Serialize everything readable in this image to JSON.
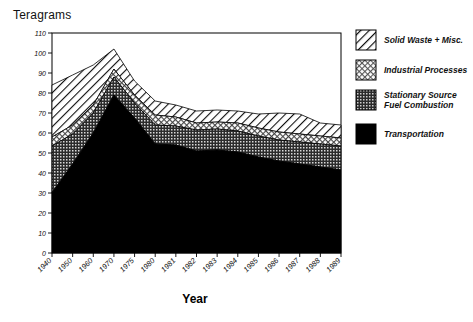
{
  "chart_data": {
    "type": "area",
    "stacked": true,
    "title": "",
    "ylabel": "Teragrams",
    "xlabel": "Year",
    "ylim": [
      0,
      110
    ],
    "yticks": [
      0,
      10,
      20,
      30,
      40,
      50,
      60,
      70,
      80,
      90,
      100,
      110
    ],
    "grid": false,
    "legend_position": "right",
    "categories": [
      "1940",
      "1950",
      "1960",
      "1970",
      "1975",
      "1980",
      "1981",
      "1982",
      "1983",
      "1984",
      "1985",
      "1986",
      "1987",
      "1988",
      "1989"
    ],
    "x": [
      "1940",
      "1950",
      "1960",
      "1970",
      "1975",
      "1980",
      "1981",
      "1982",
      "1983",
      "1984",
      "1985",
      "1986",
      "1987",
      "1988",
      "1989"
    ],
    "series": [
      {
        "name": "Transportation",
        "pattern": "solid-black",
        "color": "#000000",
        "values": [
          30.1,
          44.5,
          60.0,
          79.0,
          67.5,
          54.5,
          54.0,
          51.0,
          51.5,
          50.5,
          48.0,
          46.0,
          44.5,
          43.0,
          41.5
        ]
      },
      {
        "name": "Stationary Source Fuel Combustion",
        "pattern": "dense-dark-dots",
        "color": "#3a3a3a",
        "values": [
          23.4,
          15.0,
          10.0,
          9.0,
          7.5,
          9.5,
          9.5,
          10.5,
          10.5,
          10.5,
          10.5,
          10.5,
          11.0,
          11.5,
          12.0
        ]
      },
      {
        "name": "Industrial Processes",
        "pattern": "light-crosshatch",
        "color": "#b4b4b4",
        "values": [
          4.5,
          4.5,
          4.0,
          4.0,
          4.0,
          5.0,
          4.5,
          3.5,
          3.5,
          4.0,
          4.0,
          4.0,
          4.0,
          4.0,
          4.0
        ]
      },
      {
        "name": "Solid Waste + Misc.",
        "pattern": "diagonal-hatch",
        "color": "#ffffff",
        "values": [
          26.0,
          25.0,
          20.0,
          10.0,
          7.0,
          7.0,
          6.0,
          6.0,
          6.0,
          6.0,
          7.0,
          9.5,
          10.0,
          6.5,
          6.5
        ]
      }
    ],
    "stack_tops": {
      "transportation": [
        30.1,
        44.5,
        60.0,
        79.0,
        67.5,
        54.5,
        54.0,
        51.0,
        51.5,
        50.5,
        48.0,
        46.0,
        44.5,
        43.0,
        41.5
      ],
      "stationary_source": [
        53.5,
        59.5,
        70.0,
        88.0,
        75.0,
        64.0,
        63.5,
        61.5,
        62.0,
        61.0,
        58.5,
        56.5,
        55.5,
        54.5,
        53.5
      ],
      "industrial_processes": [
        58.0,
        64.0,
        74.0,
        92.0,
        79.0,
        69.0,
        68.0,
        65.0,
        65.5,
        65.0,
        62.5,
        60.5,
        59.5,
        58.5,
        57.5
      ],
      "total": [
        84.0,
        89.0,
        94.0,
        102.0,
        86.0,
        76.0,
        74.0,
        71.0,
        71.5,
        71.0,
        69.5,
        70.0,
        69.5,
        65.0,
        64.0
      ]
    }
  },
  "axes": {
    "ylabel": "Teragrams",
    "xlabel": "Year",
    "yticks": [
      "0",
      "10",
      "20",
      "30",
      "40",
      "50",
      "60",
      "70",
      "80",
      "90",
      "100",
      "110"
    ],
    "xticks": [
      "1940",
      "1950",
      "1960",
      "1970",
      "1975",
      "1980",
      "1981",
      "1982",
      "1983",
      "1984",
      "1985",
      "1986",
      "1987",
      "1988",
      "1989"
    ]
  },
  "legend": {
    "items": [
      {
        "label": "Solid Waste + Misc.",
        "label2": "",
        "swatch": "diagonal-hatch-swatch"
      },
      {
        "label": "Industrial Processes",
        "label2": "",
        "swatch": "light-crosshatch-swatch"
      },
      {
        "label": "Stationary Source",
        "label2": "Fuel Combustion",
        "swatch": "dense-dark-swatch"
      },
      {
        "label": "Transportation",
        "label2": "",
        "swatch": "solid-black-swatch"
      }
    ]
  }
}
